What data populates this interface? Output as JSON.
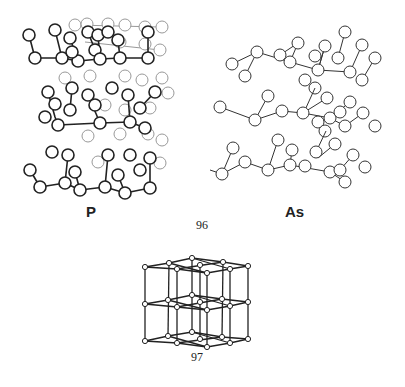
{
  "figure": {
    "panel_96": {
      "number": "96",
      "left_label": "P",
      "right_label": "As",
      "description": "Layered crystal structures of black phosphorus and arsenic"
    },
    "panel_97": {
      "number": "97",
      "description": "Simple cubic lattice (2x2x2 cells)"
    },
    "colors": {
      "ink": "#222222",
      "faint": "#888888",
      "background": "#ffffff"
    }
  }
}
